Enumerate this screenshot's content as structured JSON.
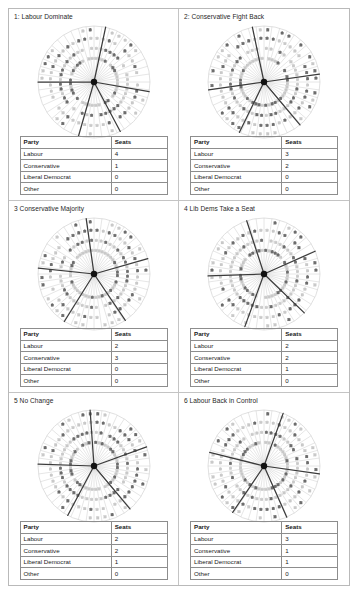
{
  "document": {
    "type": "figure-sheet",
    "panel_count": 6
  },
  "table_headers": {
    "party": "Party",
    "seats": "Seats"
  },
  "party_labels": {
    "labour": "Labour",
    "conservative": "Conservative",
    "liberal_democrat": "Liberal Democrat",
    "other": "Other"
  },
  "panels": [
    {
      "title": "1: Labour Dominate",
      "rows": [
        {
          "party": "Labour",
          "seats": "4"
        },
        {
          "party": "Conservative",
          "seats": "1"
        },
        {
          "party": "Liberal Democrat",
          "seats": "0"
        },
        {
          "party": "Other",
          "seats": "0"
        }
      ],
      "wheel": {
        "segments": 5,
        "boundaries_deg": [
          270,
          12,
          100,
          152,
          196
        ],
        "spokes": 44,
        "rings": 3
      }
    },
    {
      "title": "2: Conservative Fight Back",
      "rows": [
        {
          "party": "Labour",
          "seats": "3"
        },
        {
          "party": "Conservative",
          "seats": "2"
        },
        {
          "party": "Liberal Democrat",
          "seats": "0"
        },
        {
          "party": "Other",
          "seats": "0"
        }
      ],
      "wheel": {
        "segments": 5,
        "boundaries_deg": [
          262,
          348,
          82,
          140,
          206
        ],
        "spokes": 44,
        "rings": 3
      }
    },
    {
      "title": "3 Conservative Majority",
      "rows": [
        {
          "party": "Labour",
          "seats": "2"
        },
        {
          "party": "Conservative",
          "seats": "3"
        },
        {
          "party": "Liberal Democrat",
          "seats": "0"
        },
        {
          "party": "Other",
          "seats": "0"
        }
      ],
      "wheel": {
        "segments": 5,
        "boundaries_deg": [
          276,
          352,
          74,
          146,
          212
        ],
        "spokes": 44,
        "rings": 3
      }
    },
    {
      "title": "4 Lib Dems Take a Seat",
      "rows": [
        {
          "party": "Labour",
          "seats": "2"
        },
        {
          "party": "Conservative",
          "seats": "2"
        },
        {
          "party": "Liberal Democrat",
          "seats": "1"
        },
        {
          "party": "Other",
          "seats": "0"
        }
      ],
      "wheel": {
        "segments": 5,
        "boundaries_deg": [
          268,
          342,
          66,
          134,
          200
        ],
        "spokes": 44,
        "rings": 3
      }
    },
    {
      "title": "5 No Change",
      "rows": [
        {
          "party": "Labour",
          "seats": "2"
        },
        {
          "party": "Conservative",
          "seats": "2"
        },
        {
          "party": "Liberal Democrat",
          "seats": "1"
        },
        {
          "party": "Other",
          "seats": "0"
        }
      ],
      "wheel": {
        "segments": 5,
        "boundaries_deg": [
          272,
          356,
          70,
          140,
          208
        ],
        "spokes": 44,
        "rings": 3
      }
    },
    {
      "title": "6 Labour Back in Control",
      "rows": [
        {
          "party": "Labour",
          "seats": "3"
        },
        {
          "party": "Conservative",
          "seats": "1"
        },
        {
          "party": "Liberal Democrat",
          "seats": "1"
        },
        {
          "party": "Other",
          "seats": "0"
        }
      ],
      "wheel": {
        "segments": 5,
        "boundaries_deg": [
          284,
          20,
          98,
          156,
          214
        ],
        "spokes": 44,
        "rings": 3
      }
    }
  ],
  "colors": {
    "page_border": "#b9b9b9",
    "panel_border": "#c4c4c4",
    "spoke": "#d2d2d2",
    "divider": "#3b3b3b",
    "hub": "#111111",
    "icon_dark": "#6e6e6e",
    "icon_light": "#c9c9c9",
    "text": "#1a1a1a"
  }
}
